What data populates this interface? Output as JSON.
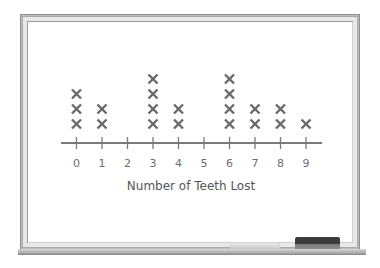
{
  "chart_data": {
    "type": "scatter",
    "subtype": "line_plot_dot_plot",
    "title": "",
    "xlabel": "Number of Teeth Lost",
    "ylabel": "",
    "categories": [
      "0",
      "1",
      "2",
      "3",
      "4",
      "5",
      "6",
      "7",
      "8",
      "9"
    ],
    "values": [
      3,
      2,
      0,
      4,
      2,
      0,
      4,
      2,
      2,
      1
    ],
    "marker": "×",
    "xlim": [
      0,
      9
    ],
    "grid": false,
    "legend": null
  },
  "colors": {
    "marker": "#6b6b6b",
    "axis": "#7a7a7a",
    "board": "#ffffff",
    "frame": "#bdbdbd",
    "eraser": "#3c3c3c"
  }
}
